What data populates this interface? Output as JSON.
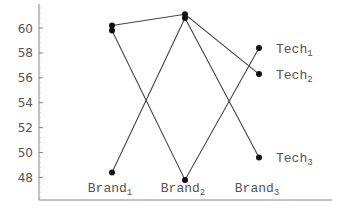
{
  "chart_data": {
    "type": "line",
    "title": "",
    "xlabel": "",
    "ylabel": "",
    "categories": [
      "Brand1",
      "Brand2",
      "Brand3"
    ],
    "category_display": [
      {
        "base": "Brand",
        "sub": "1"
      },
      {
        "base": "Brand",
        "sub": "2"
      },
      {
        "base": "Brand",
        "sub": "3"
      }
    ],
    "series": [
      {
        "name": "Tech1",
        "base": "Tech",
        "sub": "1",
        "values": [
          59.8,
          47.8,
          58.4
        ]
      },
      {
        "name": "Tech2",
        "base": "Tech",
        "sub": "2",
        "values": [
          60.2,
          61.1,
          56.3
        ]
      },
      {
        "name": "Tech3",
        "base": "Tech",
        "sub": "3",
        "values": [
          48.4,
          60.8,
          49.6
        ]
      }
    ],
    "yticks": [
      48,
      50,
      52,
      54,
      56,
      58,
      60
    ],
    "ylim": [
      46.2,
      62.1
    ],
    "grid": false,
    "legend": "direct labels at right end of each line",
    "line_color": "#444444",
    "marker_color": "#111111",
    "axis_color": "#888888"
  }
}
